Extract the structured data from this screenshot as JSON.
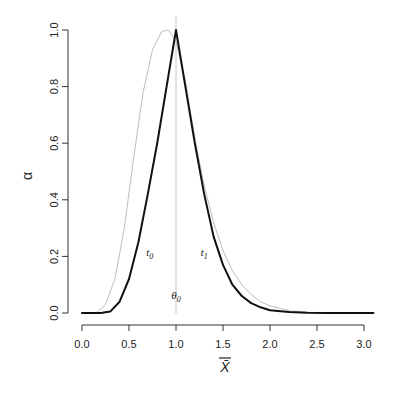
{
  "chart_data": {
    "type": "line",
    "title": "",
    "xlabel": "X̄",
    "ylabel": "α",
    "xlim": [
      0.0,
      3.1
    ],
    "ylim": [
      0.0,
      1.0
    ],
    "x_ticks": [
      "0.0",
      "0.5",
      "1.0",
      "1.5",
      "2.0",
      "2.5",
      "3.0"
    ],
    "y_ticks": [
      "0.0",
      "0.2",
      "0.4",
      "0.6",
      "0.8",
      "1.0"
    ],
    "grid": false,
    "reference_line": {
      "x": 1.0,
      "label": "θ0",
      "color": "#c8c8c8"
    },
    "series": [
      {
        "name": "dark-curve",
        "color": "#111111",
        "width": 2,
        "x": [
          0.0,
          0.2,
          0.3,
          0.4,
          0.5,
          0.6,
          0.7,
          0.8,
          0.9,
          1.0,
          1.1,
          1.2,
          1.3,
          1.4,
          1.5,
          1.6,
          1.7,
          1.8,
          1.9,
          2.0,
          2.2,
          2.4,
          2.6,
          3.1
        ],
        "y": [
          0.0,
          0.0,
          0.005,
          0.04,
          0.12,
          0.25,
          0.42,
          0.6,
          0.8,
          1.0,
          0.8,
          0.6,
          0.42,
          0.27,
          0.17,
          0.1,
          0.06,
          0.035,
          0.02,
          0.01,
          0.004,
          0.001,
          0.0,
          0.0
        ]
      },
      {
        "name": "gray-curve",
        "color": "#bdbdbd",
        "width": 1,
        "x": [
          0.0,
          0.15,
          0.25,
          0.35,
          0.45,
          0.55,
          0.65,
          0.75,
          0.85,
          0.92,
          1.0,
          1.1,
          1.2,
          1.3,
          1.4,
          1.5,
          1.6,
          1.7,
          1.8,
          1.9,
          2.0,
          2.2,
          2.4,
          3.1
        ],
        "y": [
          0.0,
          0.0,
          0.03,
          0.12,
          0.3,
          0.55,
          0.78,
          0.93,
          0.995,
          1.0,
          0.96,
          0.82,
          0.62,
          0.45,
          0.32,
          0.22,
          0.15,
          0.1,
          0.065,
          0.04,
          0.025,
          0.008,
          0.002,
          0.0
        ]
      }
    ],
    "annotations": [
      {
        "text": "t0",
        "x": 0.72,
        "y": 0.2
      },
      {
        "text": "t1",
        "x": 1.3,
        "y": 0.2
      },
      {
        "text": "θ0",
        "x": 1.0,
        "y": 0.05
      }
    ]
  }
}
